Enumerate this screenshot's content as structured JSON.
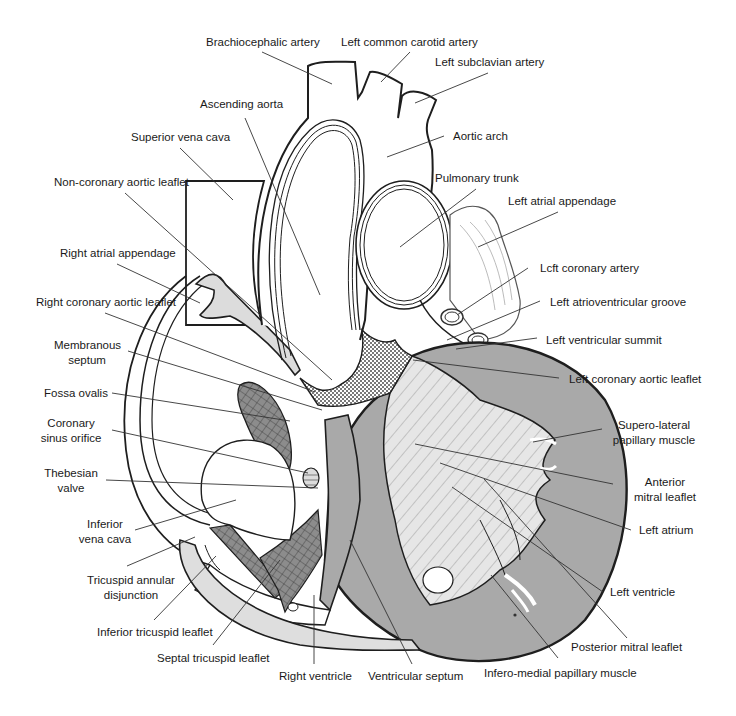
{
  "diagram": {
    "colors": {
      "outline": "#1e1e1e",
      "muscle_gray": "#a9a9a9",
      "light_gray": "#dedede",
      "mesh_gray": "#8c8c8c",
      "background": "#ffffff",
      "leader_line": "#333333"
    },
    "labels": [
      {
        "id": "brachiocephalic-artery",
        "lines": [
          "Brachiocephalic artery"
        ],
        "x": 206,
        "y": 35,
        "align": "left"
      },
      {
        "id": "left-common-carotid-artery",
        "lines": [
          "Left common carotid artery"
        ],
        "x": 341,
        "y": 35,
        "align": "left"
      },
      {
        "id": "left-subclavian-artery",
        "lines": [
          "Left subclavian artery"
        ],
        "x": 435,
        "y": 55,
        "align": "left"
      },
      {
        "id": "ascending-aorta",
        "lines": [
          "Ascending aorta"
        ],
        "x": 200,
        "y": 97,
        "align": "left"
      },
      {
        "id": "superior-vena-cava",
        "lines": [
          "Superior vena cava"
        ],
        "x": 131,
        "y": 130,
        "align": "left"
      },
      {
        "id": "aortic-arch",
        "lines": [
          "Aortic arch"
        ],
        "x": 453,
        "y": 129,
        "align": "left"
      },
      {
        "id": "non-coronary-aortic-leaflet",
        "lines": [
          "Non-coronary aortic leaflet"
        ],
        "x": 54,
        "y": 175,
        "align": "left"
      },
      {
        "id": "pulmonary-trunk",
        "lines": [
          "Pulmonary trunk"
        ],
        "x": 435,
        "y": 171,
        "align": "left"
      },
      {
        "id": "left-atrial-appendage",
        "lines": [
          "Left atrial appendage"
        ],
        "x": 508,
        "y": 194,
        "align": "left"
      },
      {
        "id": "right-atrial-appendage",
        "lines": [
          "Right atrial appendage"
        ],
        "x": 60,
        "y": 246,
        "align": "left"
      },
      {
        "id": "left-coronary-artery",
        "lines": [
          "Lcft coronary artery"
        ],
        "x": 540,
        "y": 261,
        "align": "left"
      },
      {
        "id": "right-coronary-aortic-leaflet",
        "lines": [
          "Right coronary aortic leaflet"
        ],
        "x": 36,
        "y": 295,
        "align": "left"
      },
      {
        "id": "left-atrioventricular-groove",
        "lines": [
          "Left atrioventricular groove"
        ],
        "x": 550,
        "y": 295,
        "align": "left"
      },
      {
        "id": "membranous-septum",
        "lines": [
          "Membranous",
          "septum"
        ],
        "x": 54,
        "y": 338,
        "align": "center",
        "w": 66
      },
      {
        "id": "left-ventricular-summit",
        "lines": [
          "Left ventricular summit"
        ],
        "x": 546,
        "y": 333,
        "align": "left"
      },
      {
        "id": "left-coronary-aortic-leaflet",
        "lines": [
          "Left coronary aortic leaflet"
        ],
        "x": 569,
        "y": 372,
        "align": "left"
      },
      {
        "id": "fossa-ovalis",
        "lines": [
          "Fossa ovalis"
        ],
        "x": 44,
        "y": 386,
        "align": "left"
      },
      {
        "id": "supero-lateral-papillary-muscle",
        "lines": [
          "Supero-lateral",
          "papillary muscle"
        ],
        "x": 612,
        "y": 418,
        "align": "center",
        "w": 84
      },
      {
        "id": "coronary-sinus-orifice",
        "lines": [
          "Coronary",
          "sinus orifice"
        ],
        "x": 36,
        "y": 416,
        "align": "center",
        "w": 70
      },
      {
        "id": "thebesian-valve",
        "lines": [
          "Thebesian",
          "valve"
        ],
        "x": 42,
        "y": 466,
        "align": "center",
        "w": 58
      },
      {
        "id": "anterior-mitral-leaflet",
        "lines": [
          "Anterior",
          "mitral leaflet"
        ],
        "x": 627,
        "y": 475,
        "align": "center",
        "w": 76
      },
      {
        "id": "left-atrium",
        "lines": [
          "Left atrium"
        ],
        "x": 639,
        "y": 523,
        "align": "left"
      },
      {
        "id": "inferior-vena-cava",
        "lines": [
          "Inferior",
          "vena cava"
        ],
        "x": 77,
        "y": 517,
        "align": "center",
        "w": 56
      },
      {
        "id": "tricuspid-annular-disjunction",
        "lines": [
          "Tricuspid annular",
          "disjunction"
        ],
        "x": 83,
        "y": 573,
        "align": "center",
        "w": 96
      },
      {
        "id": "left-ventricle",
        "lines": [
          "Left ventricle"
        ],
        "x": 610,
        "y": 585,
        "align": "left"
      },
      {
        "id": "posterior-mitral-leaflet",
        "lines": [
          "Posterior mitral leaflet"
        ],
        "x": 571,
        "y": 640,
        "align": "left"
      },
      {
        "id": "inferior-tricuspid-leaflet",
        "lines": [
          "Inferior tricuspid leaflet"
        ],
        "x": 97,
        "y": 625,
        "align": "left"
      },
      {
        "id": "septal-tricuspid-leaflet",
        "lines": [
          "Septal tricuspid leaflet"
        ],
        "x": 157,
        "y": 651,
        "align": "left"
      },
      {
        "id": "infero-medial-papillary-muscle",
        "lines": [
          "Infero-medial papillary muscle"
        ],
        "x": 484,
        "y": 666,
        "align": "left"
      },
      {
        "id": "right-ventricle",
        "lines": [
          "Right ventricle"
        ],
        "x": 279,
        "y": 669,
        "align": "left"
      },
      {
        "id": "ventricular-septum",
        "lines": [
          "Ventricular septum"
        ],
        "x": 368,
        "y": 669,
        "align": "left"
      }
    ],
    "leader_lines": [
      {
        "for": "brachiocephalic-artery",
        "x1": 262,
        "y1": 52,
        "x2": 332,
        "y2": 84
      },
      {
        "for": "left-common-carotid-artery",
        "x1": 410,
        "y1": 52,
        "x2": 381,
        "y2": 82
      },
      {
        "for": "left-subclavian-artery",
        "x1": 488,
        "y1": 73,
        "x2": 415,
        "y2": 103
      },
      {
        "for": "ascending-aorta",
        "x1": 245,
        "y1": 118,
        "x2": 320,
        "y2": 295
      },
      {
        "for": "superior-vena-cava",
        "x1": 180,
        "y1": 148,
        "x2": 233,
        "y2": 200
      },
      {
        "for": "aortic-arch",
        "x1": 444,
        "y1": 136,
        "x2": 387,
        "y2": 157
      },
      {
        "for": "non-coronary-aortic-leaflet",
        "x1": 125,
        "y1": 193,
        "x2": 332,
        "y2": 380
      },
      {
        "for": "pulmonary-trunk",
        "x1": 476,
        "y1": 189,
        "x2": 400,
        "y2": 247
      },
      {
        "for": "left-atrial-appendage",
        "x1": 558,
        "y1": 212,
        "x2": 478,
        "y2": 247
      },
      {
        "for": "right-atrial-appendage",
        "x1": 117,
        "y1": 264,
        "x2": 200,
        "y2": 303
      },
      {
        "for": "left-coronary-artery",
        "x1": 528,
        "y1": 268,
        "x2": 457,
        "y2": 315
      },
      {
        "for": "right-coronary-aortic-leaflet",
        "x1": 105,
        "y1": 313,
        "x2": 315,
        "y2": 392
      },
      {
        "for": "left-atrioventricular-groove",
        "x1": 540,
        "y1": 301,
        "x2": 447,
        "y2": 340
      },
      {
        "for": "membranous-septum",
        "x1": 128,
        "y1": 351,
        "x2": 322,
        "y2": 410
      },
      {
        "for": "left-ventricular-summit",
        "x1": 537,
        "y1": 338,
        "x2": 456,
        "y2": 349
      },
      {
        "for": "left-coronary-aortic-leaflet",
        "x1": 559,
        "y1": 378,
        "x2": 413,
        "y2": 360
      },
      {
        "for": "fossa-ovalis",
        "x1": 112,
        "y1": 393,
        "x2": 290,
        "y2": 421
      },
      {
        "for": "supero-lateral-papillary-muscle",
        "x1": 602,
        "y1": 429,
        "x2": 533,
        "y2": 442
      },
      {
        "for": "coronary-sinus-orifice",
        "x1": 112,
        "y1": 430,
        "x2": 308,
        "y2": 473
      },
      {
        "for": "thebesian-valve",
        "x1": 106,
        "y1": 480,
        "x2": 318,
        "y2": 488
      },
      {
        "for": "anterior-mitral-leaflet",
        "x1": 613,
        "y1": 484,
        "x2": 415,
        "y2": 444
      },
      {
        "for": "left-atrium",
        "x1": 631,
        "y1": 530,
        "x2": 440,
        "y2": 463
      },
      {
        "for": "inferior-vena-cava",
        "x1": 135,
        "y1": 530,
        "x2": 236,
        "y2": 500
      },
      {
        "for": "tricuspid-annular-disjunction",
        "x1": 127,
        "y1": 566,
        "x2": 195,
        "y2": 537
      },
      {
        "for": "left-ventricle",
        "x1": 603,
        "y1": 592,
        "x2": 452,
        "y2": 487
      },
      {
        "for": "posterior-mitral-leaflet",
        "x1": 627,
        "y1": 638,
        "x2": 484,
        "y2": 479
      },
      {
        "for": "inferior-tricuspid-leaflet",
        "x1": 154,
        "y1": 620,
        "x2": 216,
        "y2": 556
      },
      {
        "for": "septal-tricuspid-leaflet",
        "x1": 213,
        "y1": 645,
        "x2": 280,
        "y2": 560
      },
      {
        "for": "infero-medial-papillary-muscle",
        "x1": 558,
        "y1": 658,
        "x2": 491,
        "y2": 575
      },
      {
        "for": "right-ventricle",
        "x1": 314,
        "y1": 664,
        "x2": 314,
        "y2": 595
      },
      {
        "for": "ventricular-septum",
        "x1": 412,
        "y1": 664,
        "x2": 350,
        "y2": 540
      }
    ]
  }
}
